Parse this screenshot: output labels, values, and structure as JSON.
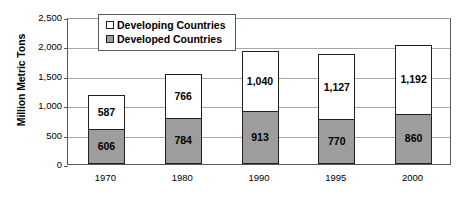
{
  "chart_data": {
    "type": "bar",
    "subtype": "stacked-vertical",
    "title": "",
    "xlabel": "",
    "ylabel": "Million Metric Tons",
    "ylim": [
      0,
      2500
    ],
    "ytick_values": [
      2500,
      2000,
      1500,
      1000,
      500,
      0
    ],
    "ytick_labels": [
      "2,500",
      "2,000",
      "1,500",
      "1,000",
      "500",
      "0"
    ],
    "grid": true,
    "legend_position": "top-left-inside",
    "categories": [
      "1970",
      "1980",
      "1990",
      "1995",
      "2000"
    ],
    "series": [
      {
        "name": "Developing Countries",
        "color": "#ffffff",
        "values": [
          587,
          766,
          1040,
          1127,
          1192
        ],
        "labels": [
          "587",
          "766",
          "1,040",
          "1,127",
          "1,192"
        ]
      },
      {
        "name": "Developed Countries",
        "color": "#9d9d9d",
        "values": [
          606,
          784,
          913,
          770,
          860
        ],
        "labels": [
          "606",
          "784",
          "913",
          "770",
          "860"
        ]
      }
    ],
    "totals": [
      1193,
      1550,
      1953,
      1897,
      2052
    ]
  },
  "legend": {
    "entries": [
      {
        "label": "Developing Countries",
        "swatch": "unfilled-square-icon"
      },
      {
        "label": "Developed Countries",
        "swatch": "filled-square-icon"
      }
    ]
  },
  "colors": {
    "developing_fill": "#ffffff",
    "developed_fill": "#9d9d9d",
    "bar_outline": "#231f20",
    "gridline": "#a7a7a7",
    "axis": "#58595b",
    "background": "#ffffff"
  }
}
